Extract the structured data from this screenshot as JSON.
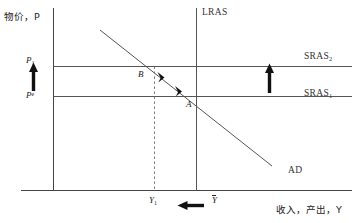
{
  "figure": {
    "type": "ad-as-diagram",
    "axes": {
      "y_title": "物价，P",
      "x_title": "收入，产出，Y"
    },
    "price_ticks": [
      {
        "key": "p1",
        "text": "P",
        "sub": "1"
      },
      {
        "key": "pe",
        "text": "P",
        "sup": "e"
      }
    ],
    "output_ticks": [
      {
        "key": "y1",
        "text": "Y",
        "sub": "1"
      },
      {
        "key": "ybar",
        "text": "Y",
        "bar": true
      }
    ],
    "curves": [
      {
        "key": "lras",
        "label": "LRAS"
      },
      {
        "key": "sras2",
        "label": "SRAS",
        "sub": "2"
      },
      {
        "key": "sras1",
        "label": "SRAS",
        "sub": "1"
      },
      {
        "key": "ad",
        "label": "AD"
      }
    ],
    "points": [
      {
        "key": "a",
        "label": "A"
      },
      {
        "key": "b",
        "label": "B"
      }
    ],
    "annotations": {
      "price_shift_arrow": "up",
      "sras_shift_arrow": "up",
      "output_shift_arrow": "left",
      "ad_movement_arrows": "up-left"
    },
    "colors": {
      "line": "#555555",
      "axis": "#444444",
      "text": "#1a1a1a",
      "arrow": "#111111",
      "background": "#ffffff"
    }
  }
}
